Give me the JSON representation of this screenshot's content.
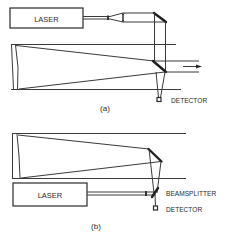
{
  "colors": {
    "background": "#ffffff",
    "line": "#3a3a3a",
    "mirror": "#1e1e1e",
    "text": "#2a2a2a"
  },
  "panel_a": {
    "caption": "(a)",
    "laser_label": "LASER",
    "detector_label": "DETECTOR",
    "components": [
      "laser",
      "beam-expander",
      "fold-mirror",
      "telescope-primary-mirror",
      "diagonal-mirror",
      "output-beam-arrow",
      "detector"
    ]
  },
  "panel_b": {
    "caption": "(b)",
    "laser_label": "LASER",
    "beamsplitter_label": "BEAMSPLITTER",
    "detector_label": "DETECTOR",
    "components": [
      "telescope-primary-mirror",
      "diagonal-mirror",
      "laser",
      "beamsplitter",
      "detector"
    ]
  }
}
